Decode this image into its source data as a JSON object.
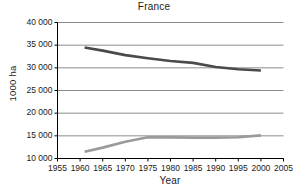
{
  "chart_data": {
    "type": "line",
    "title": "France",
    "xlabel": "Year",
    "ylabel": "1000 ha",
    "xlim": [
      1955,
      2005
    ],
    "ylim": [
      10000,
      40000
    ],
    "grid": true,
    "legend": "none",
    "xticks": [
      "1955",
      "1960",
      "1965",
      "1970",
      "1975",
      "1980",
      "1985",
      "1990",
      "1995",
      "2000",
      "2005"
    ],
    "xtick_values": [
      1955,
      1960,
      1965,
      1970,
      1975,
      1980,
      1985,
      1990,
      1995,
      2000,
      2005
    ],
    "yticks": [
      "10 000",
      "15 000",
      "20 000",
      "25 000",
      "30 000",
      "35 000",
      "40 000"
    ],
    "ytick_values": [
      10000,
      15000,
      20000,
      25000,
      30000,
      35000,
      40000
    ],
    "series": [
      {
        "name": "upper-series",
        "color": "#4a4a4a",
        "x": [
          1961,
          1965,
          1970,
          1975,
          1980,
          1985,
          1990,
          1995,
          2000
        ],
        "values": [
          34500,
          33800,
          32800,
          32100,
          31500,
          31100,
          30200,
          29700,
          29400
        ]
      },
      {
        "name": "lower-series",
        "color": "#9a9a9a",
        "x": [
          1961,
          1965,
          1970,
          1975,
          1980,
          1985,
          1990,
          1995,
          2000
        ],
        "values": [
          11500,
          12400,
          13700,
          14700,
          14650,
          14600,
          14600,
          14700,
          15100
        ]
      }
    ]
  }
}
